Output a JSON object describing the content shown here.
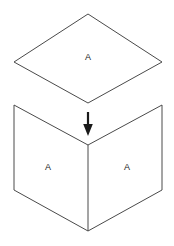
{
  "figure": {
    "background_color": "#ffffff",
    "stroke_color": "#4a4a4a",
    "arrow_color": "#1a1a1a",
    "label_color": "#1a1a1a",
    "canvas": {
      "width": 174,
      "height": 246
    }
  },
  "top_shape": {
    "name": "flat-parallelogram",
    "points": "88,14 162,62 88,103 14,62",
    "label": "A",
    "label_x": 88,
    "label_y": 58
  },
  "arrow": {
    "name": "fold-direction-arrow",
    "shaft": {
      "x1": 88,
      "y1": 112,
      "x2": 88,
      "y2": 127
    },
    "head": "88,136 83.2,124 92.8,124",
    "direction": "down"
  },
  "bottom_shape": {
    "name": "folded-v-shape",
    "outline": "14,105 88,145 162,105 162,190 88,231 14,190",
    "fold_line": {
      "x1": 88,
      "y1": 145,
      "x2": 88,
      "y2": 231
    },
    "panels": [
      {
        "name": "left-panel",
        "label": "A",
        "label_x": 48,
        "label_y": 168
      },
      {
        "name": "right-panel",
        "label": "A",
        "label_x": 127,
        "label_y": 168
      }
    ]
  }
}
